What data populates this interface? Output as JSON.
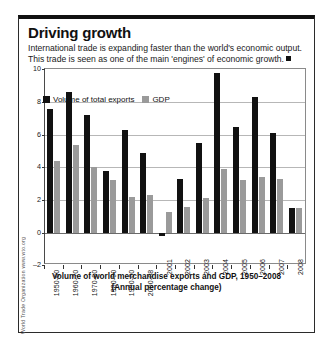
{
  "card": {
    "title": "Driving growth",
    "standfirst_line1": "International trade is expanding faster than the world's economic output.",
    "standfirst_line2": "This trade is seen as one of the main 'engines' of economic growth.",
    "source": "World Trade Organization www.wto.org"
  },
  "legend": {
    "exports_label": "Volume of total exports",
    "gdp_label": "GDP",
    "exports_color": "#111111",
    "gdp_color": "#9a9a9a"
  },
  "caption": {
    "line1": "Volume of world merchandise exports and GDP, 1950–2008",
    "line2": "(Annual percentage change)"
  },
  "chart_data": {
    "type": "bar",
    "subtitle": "(Annual percentage change)",
    "xlabel": "",
    "ylabel": "",
    "ylim": [
      -2,
      10
    ],
    "yticks": [
      10,
      8,
      6,
      4,
      2,
      0,
      -2
    ],
    "grid": true,
    "legend_position": "top-left",
    "categories": [
      "1950-60",
      "1960-70",
      "1970-80",
      "1980-90",
      "1990-00",
      "2000-08",
      "2001",
      "2002",
      "2003",
      "2004",
      "2005",
      "2006",
      "2007",
      "2008"
    ],
    "series": [
      {
        "name": "Volume of total exports",
        "color": "#111111",
        "values": [
          7.6,
          8.6,
          7.2,
          3.8,
          6.3,
          4.9,
          -0.2,
          3.3,
          5.5,
          9.8,
          6.5,
          8.3,
          6.1,
          1.5
        ]
      },
      {
        "name": "GDP",
        "color": "#9a9a9a",
        "values": [
          4.4,
          5.4,
          4.0,
          3.2,
          2.2,
          2.3,
          1.3,
          1.6,
          2.1,
          3.9,
          3.2,
          3.4,
          3.3,
          1.5
        ]
      }
    ]
  }
}
